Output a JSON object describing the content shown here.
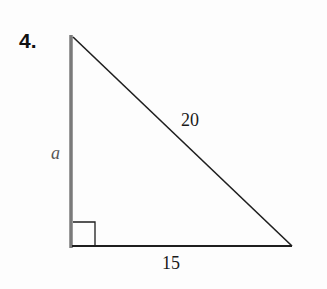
{
  "problem": {
    "number": "4."
  },
  "triangle": {
    "type": "right-triangle",
    "vertices": {
      "top": [
        71,
        37
      ],
      "right_angle": [
        71,
        246
      ],
      "bottom_right": [
        292,
        246
      ]
    },
    "sides": {
      "vertical_leg": {
        "label": "a",
        "style": "italic"
      },
      "hypotenuse": {
        "label": "20"
      },
      "base": {
        "label": "15"
      }
    },
    "right_angle_marker": true,
    "colors": {
      "vertical_leg": "#7a7a7a",
      "edges": "#1e1e1e"
    }
  }
}
